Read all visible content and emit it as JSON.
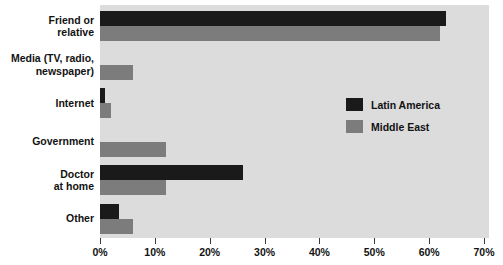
{
  "chart_data": {
    "type": "bar",
    "orientation": "horizontal",
    "title": "",
    "subtitle": "",
    "xlabel": "",
    "ylabel": "",
    "xlim": [
      0,
      70
    ],
    "xtick_labels": [
      "0%",
      "10%",
      "20%",
      "30%",
      "40%",
      "50%",
      "60%",
      "70%"
    ],
    "xtick_values": [
      0,
      10,
      20,
      30,
      40,
      50,
      60,
      70
    ],
    "grid": false,
    "legend_position": "center-right",
    "categories": [
      "Friend or relative",
      "Media (TV, radio, newspaper)",
      "Internet",
      "Government",
      "Doctor at home",
      "Other"
    ],
    "category_lines": [
      [
        "Friend or",
        "relative"
      ],
      [
        "Media (TV, radio,",
        "newspaper)"
      ],
      [
        "Internet"
      ],
      [
        "Government"
      ],
      [
        "Doctor",
        "at home"
      ],
      [
        "Other"
      ]
    ],
    "series": [
      {
        "name": "Latin America",
        "color": "#1a1a1a",
        "values": [
          63,
          0,
          1,
          0,
          26,
          3.5
        ]
      },
      {
        "name": "Middle East",
        "color": "#7c7c7c",
        "values": [
          62,
          6,
          2,
          12,
          12,
          6
        ]
      }
    ]
  },
  "legend": {
    "items": [
      {
        "label": "Latin America",
        "color": "#1a1a1a"
      },
      {
        "label": "Middle East",
        "color": "#7c7c7c"
      }
    ]
  },
  "colors": {
    "plot_background": "#dcdcdc",
    "page_background": "#ffffff",
    "text": "#121212",
    "latin_america": "#1a1a1a",
    "middle_east": "#7c7c7c"
  }
}
